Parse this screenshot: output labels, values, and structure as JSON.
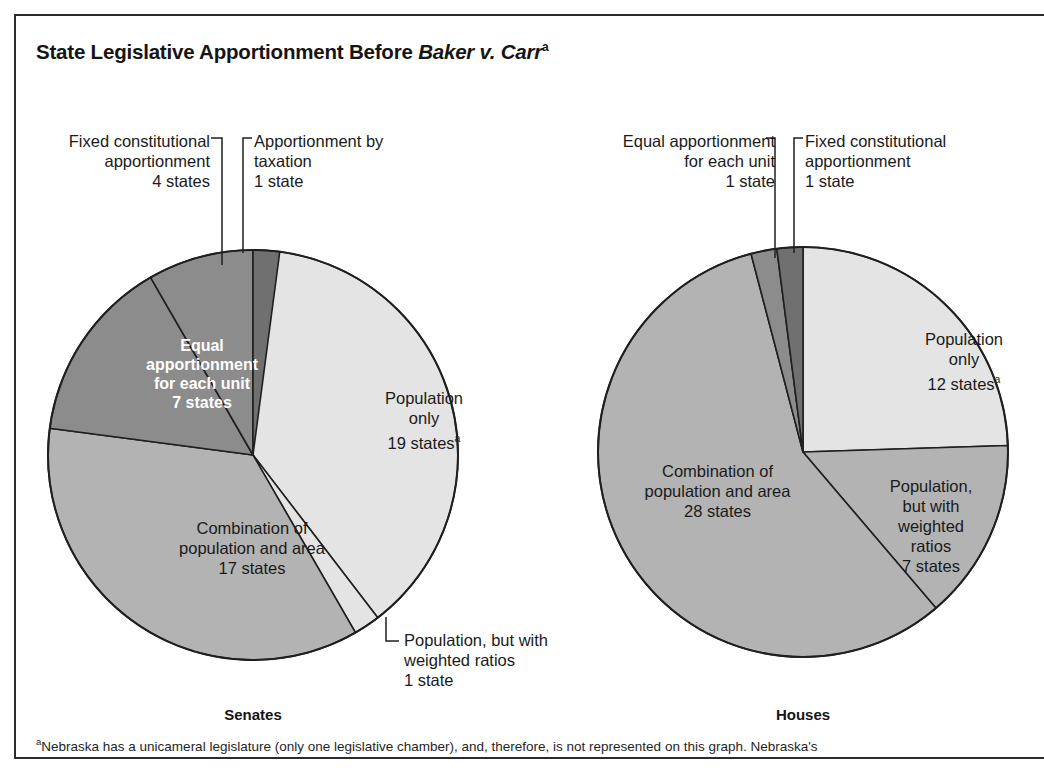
{
  "figure": {
    "title_prefix": "State Legislative Apportionment Before ",
    "title_italic": "Baker v. Carr",
    "title_superscript": "a",
    "footnote_marker": "a",
    "footnote_text": "Nebraska has a unicameral legislature (only one legislative chamber), and, therefore, is not represented on this graph. Nebraska's"
  },
  "colors": {
    "slice_light": "#e4e4e4",
    "slice_medium": "#b3b3b3",
    "slice_dark": "#8c8c8c",
    "slice_darkest": "#707070",
    "outline": "#1f1f1f",
    "frame": "#2b2b2b",
    "text": "#1a1a1a",
    "text_on_dark": "#ffffff"
  },
  "charts": [
    {
      "id": "senates",
      "caption": "Senates",
      "cx": 253,
      "cy": 455,
      "r": 205,
      "total_states": 48,
      "caption_x": 253,
      "caption_y": 706,
      "slices": [
        {
          "key": "population-only",
          "name": "Population only",
          "value": 19,
          "fill": "#e4e4e4",
          "label_lines": [
            "Population",
            "only",
            "19 states"
          ],
          "label_superscript": "a",
          "label_placement": "inside",
          "label_color": "dark",
          "label_x": 349,
          "label_y": 388,
          "label_w": 150
        },
        {
          "key": "population-weighted-ratios",
          "name": "Population, but with weighted ratios",
          "value": 1,
          "fill": "#e4e4e4",
          "label_lines": [
            "Population, but with",
            "weighted ratios",
            "1 state"
          ],
          "label_placement": "callout",
          "label_color": "dark",
          "label_x": 404,
          "label_y": 630,
          "label_w": 200,
          "align": "left",
          "leader": {
            "type": "elbow-left",
            "x1": 386,
            "y1": 617,
            "x2": 386,
            "y2": 641,
            "x3": 399,
            "y3": 641
          }
        },
        {
          "key": "combination-population-area",
          "name": "Combination of population and area",
          "value": 17,
          "fill": "#b3b3b3",
          "label_lines": [
            "Combination of",
            "population and area",
            "17 states"
          ],
          "label_placement": "inside",
          "label_color": "dark",
          "label_x": 147,
          "label_y": 518,
          "label_w": 210
        },
        {
          "key": "equal-apportionment-each-unit",
          "name": "Equal apportionment for each unit",
          "value": 7,
          "fill": "#8c8c8c",
          "label_lines": [
            "Equal",
            "apportionment",
            "for each unit",
            "7 states"
          ],
          "label_placement": "inside",
          "label_color": "white",
          "label_x": 122,
          "label_y": 336,
          "label_w": 160
        },
        {
          "key": "fixed-constitutional-apportionment",
          "name": "Fixed constitutional apportionment",
          "value": 4,
          "fill": "#8c8c8c",
          "label_lines": [
            "Fixed constitutional",
            "apportionment",
            "4 states"
          ],
          "label_placement": "callout",
          "label_color": "dark",
          "label_x": 25,
          "label_y": 131,
          "label_w": 185,
          "align": "right",
          "leader": {
            "type": "elbow-right",
            "x1": 222,
            "y1": 265,
            "x2": 222,
            "y2": 138,
            "x3": 211,
            "y3": 138
          }
        },
        {
          "key": "apportionment-by-taxation",
          "name": "Apportionment by taxation",
          "value": 1,
          "fill": "#707070",
          "label_lines": [
            "Apportionment by",
            "taxation",
            "1 state"
          ],
          "label_placement": "callout",
          "label_color": "dark",
          "label_x": 254,
          "label_y": 131,
          "label_w": 185,
          "align": "left",
          "leader": {
            "type": "elbow-left",
            "x1": 243,
            "y1": 253,
            "x2": 243,
            "y2": 138,
            "x3": 252,
            "y3": 138
          }
        }
      ]
    },
    {
      "id": "houses",
      "caption": "Houses",
      "cx": 803,
      "cy": 452,
      "r": 205,
      "total_states": 49,
      "caption_x": 803,
      "caption_y": 706,
      "slices": [
        {
          "key": "population-only",
          "name": "Population only",
          "value": 12,
          "fill": "#e4e4e4",
          "label_lines": [
            "Population",
            "only",
            "12 states"
          ],
          "label_superscript": "a",
          "label_placement": "inside",
          "label_color": "dark",
          "label_x": 889,
          "label_y": 329,
          "label_w": 150
        },
        {
          "key": "population-weighted-ratios",
          "name": "Population, but with weighted ratios",
          "value": 7,
          "fill": "#b3b3b3",
          "label_lines": [
            "Population,",
            "but with",
            "weighted",
            "ratios",
            "7 states"
          ],
          "label_placement": "inside",
          "label_color": "dark",
          "label_x": 866,
          "label_y": 476,
          "label_w": 130
        },
        {
          "key": "combination-population-area",
          "name": "Combination of population and area",
          "value": 28,
          "fill": "#b3b3b3",
          "label_lines": [
            "Combination of",
            "population and area",
            "28 states"
          ],
          "label_placement": "inside",
          "label_color": "dark",
          "label_x": 610,
          "label_y": 461,
          "label_w": 215
        },
        {
          "key": "equal-apportionment-each-unit",
          "name": "Equal apportionment for each unit",
          "value": 1,
          "fill": "#8c8c8c",
          "label_lines": [
            "Equal apportionment",
            "for each unit",
            "1 state"
          ],
          "label_placement": "callout",
          "label_color": "dark",
          "label_x": 580,
          "label_y": 131,
          "label_w": 195,
          "align": "right",
          "leader": {
            "type": "elbow-right",
            "x1": 775,
            "y1": 258,
            "x2": 775,
            "y2": 138,
            "x3": 766,
            "y3": 138
          }
        },
        {
          "key": "fixed-constitutional-apportionment",
          "name": "Fixed constitutional apportionment",
          "value": 1,
          "fill": "#707070",
          "label_lines": [
            "Fixed constitutional",
            "apportionment",
            "1 state"
          ],
          "label_placement": "callout",
          "label_color": "dark",
          "label_x": 805,
          "label_y": 131,
          "label_w": 195,
          "align": "left",
          "leader": {
            "type": "elbow-left",
            "x1": 794,
            "y1": 253,
            "x2": 794,
            "y2": 138,
            "x3": 803,
            "y3": 138
          }
        }
      ]
    }
  ],
  "chart_data": {
    "type": "pie",
    "title": "State Legislative Apportionment Before Baker v. Carr",
    "charts": [
      {
        "name": "Senates",
        "total": 48,
        "labels": [
          "Population only",
          "Population, but with weighted ratios",
          "Combination of population and area",
          "Equal apportionment for each unit",
          "Fixed constitutional apportionment",
          "Apportionment by taxation"
        ],
        "values": [
          19,
          1,
          17,
          7,
          4,
          1
        ],
        "units": "states"
      },
      {
        "name": "Houses",
        "total": 49,
        "labels": [
          "Population only",
          "Population, but with weighted ratios",
          "Combination of population and area",
          "Equal apportionment for each unit",
          "Fixed constitutional apportionment"
        ],
        "values": [
          12,
          7,
          28,
          1,
          1
        ],
        "units": "states"
      }
    ],
    "legend_position": "none",
    "grid": false
  }
}
